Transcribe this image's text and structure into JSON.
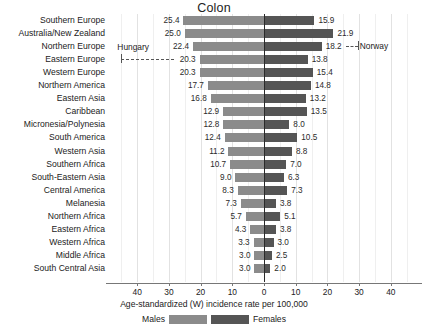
{
  "chart_data": {
    "type": "bar",
    "title": "Colon",
    "subtitle": "",
    "xlabel": "Age-standardized (W) incidence rate per 100,000",
    "ylabel": "",
    "orientation": "horizontal-diverging",
    "grid": true,
    "legend_position": "bottom",
    "xlim": [
      -50,
      50
    ],
    "xticks": [
      -40,
      -30,
      -20,
      -10,
      0,
      10,
      20,
      30,
      40
    ],
    "xtick_labels": [
      "40",
      "30",
      "20",
      "10",
      "0",
      "10",
      "20",
      "30",
      "40"
    ],
    "categories": [
      "Southern Europe",
      "Australia/New Zealand",
      "Northern Europe",
      "Eastern Europe",
      "Western Europe",
      "Northern America",
      "Eastern Asia",
      "Caribbean",
      "Micronesia/Polynesia",
      "South America",
      "Western Asia",
      "Southern Africa",
      "South-Eastern Asia",
      "Central America",
      "Melanesia",
      "Northern Africa",
      "Eastern Africa",
      "Western Africa",
      "Middle Africa",
      "South Central Asia"
    ],
    "series": [
      {
        "name": "Males",
        "color": "#8b8b8b",
        "direction": "left",
        "values": [
          25.4,
          25.0,
          22.4,
          20.3,
          20.3,
          17.7,
          16.8,
          12.9,
          12.8,
          12.4,
          11.2,
          10.7,
          9.0,
          8.3,
          7.3,
          5.7,
          4.3,
          3.3,
          3.0,
          3.0
        ],
        "labels": [
          "25.4",
          "25.0",
          "22.4",
          "20.3",
          "20.3",
          "17.7",
          "16.8",
          "12.9",
          "12.8",
          "12.4",
          "11.2",
          "10.7",
          "9.0",
          "8.3",
          "7.3",
          "5.7",
          "4.3",
          "3.3",
          "3.0",
          "3.0"
        ]
      },
      {
        "name": "Females",
        "color": "#555555",
        "direction": "right",
        "values": [
          15.9,
          21.9,
          18.2,
          13.8,
          15.4,
          14.8,
          13.2,
          13.5,
          8.0,
          10.5,
          8.8,
          7.0,
          6.3,
          7.3,
          3.8,
          5.1,
          3.8,
          3.0,
          2.5,
          2.0
        ],
        "labels": [
          "15.9",
          "21.9",
          "18.2",
          "13.8",
          "15.4",
          "14.8",
          "13.2",
          "13.5",
          "8.0",
          "10.5",
          "8.8",
          "7.0",
          "6.3",
          "7.3",
          "3.8",
          "5.1",
          "3.8",
          "3.0",
          "2.5",
          "2.0"
        ]
      }
    ],
    "annotations": [
      {
        "text": "Hungary",
        "points_to_category": "Eastern Europe",
        "side": "left",
        "value": 45.0
      },
      {
        "text": "Norway",
        "points_to_category": "Northern Europe",
        "side": "right",
        "value": 26.0
      }
    ]
  },
  "legend": {
    "male_label": "Males",
    "female_label": "Females"
  }
}
